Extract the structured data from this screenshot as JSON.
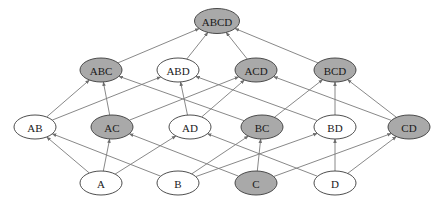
{
  "diagram": {
    "type": "hasse-diagram",
    "colors": {
      "highlighted_fill": "#a9a9a9",
      "normal_fill": "#ffffff",
      "stroke": "#3a3a3a",
      "edge": "#7a7a7a",
      "text": "#1a1a1a"
    },
    "node_size": {
      "rx": 21,
      "ry": 12,
      "top_rx": 22.5,
      "top_ry": 12.5
    },
    "nodes": [
      {
        "id": "ABCD",
        "label": "ABCD",
        "x": 217,
        "y": 21,
        "highlighted": true
      },
      {
        "id": "ABC",
        "label": "ABC",
        "x": 101,
        "y": 70,
        "highlighted": true
      },
      {
        "id": "ABD",
        "label": "ABD",
        "x": 178,
        "y": 70,
        "highlighted": false
      },
      {
        "id": "ACD",
        "label": "ACD",
        "x": 256,
        "y": 70,
        "highlighted": true
      },
      {
        "id": "BCD",
        "label": "BCD",
        "x": 335,
        "y": 70,
        "highlighted": true
      },
      {
        "id": "AB",
        "label": "AB",
        "x": 35,
        "y": 127,
        "highlighted": false
      },
      {
        "id": "AC",
        "label": "AC",
        "x": 112,
        "y": 127,
        "highlighted": true
      },
      {
        "id": "AD",
        "label": "AD",
        "x": 190,
        "y": 127,
        "highlighted": false
      },
      {
        "id": "BC",
        "label": "BC",
        "x": 262,
        "y": 127,
        "highlighted": true
      },
      {
        "id": "BD",
        "label": "BD",
        "x": 335,
        "y": 127,
        "highlighted": false
      },
      {
        "id": "CD",
        "label": "CD",
        "x": 409,
        "y": 127,
        "highlighted": true
      },
      {
        "id": "A",
        "label": "A",
        "x": 101,
        "y": 183,
        "highlighted": false
      },
      {
        "id": "B",
        "label": "B",
        "x": 178,
        "y": 183,
        "highlighted": false
      },
      {
        "id": "C",
        "label": "C",
        "x": 256,
        "y": 183,
        "highlighted": true
      },
      {
        "id": "D",
        "label": "D",
        "x": 335,
        "y": 183,
        "highlighted": false
      }
    ],
    "edges": [
      {
        "from": "ABC",
        "to": "ABCD"
      },
      {
        "from": "ABD",
        "to": "ABCD"
      },
      {
        "from": "ACD",
        "to": "ABCD"
      },
      {
        "from": "BCD",
        "to": "ABCD"
      },
      {
        "from": "AB",
        "to": "ABC"
      },
      {
        "from": "AB",
        "to": "ABD"
      },
      {
        "from": "AC",
        "to": "ABC"
      },
      {
        "from": "AC",
        "to": "ACD"
      },
      {
        "from": "AD",
        "to": "ABD"
      },
      {
        "from": "AD",
        "to": "ACD"
      },
      {
        "from": "BC",
        "to": "ABC"
      },
      {
        "from": "BC",
        "to": "BCD"
      },
      {
        "from": "BD",
        "to": "ABD"
      },
      {
        "from": "BD",
        "to": "BCD"
      },
      {
        "from": "CD",
        "to": "ACD"
      },
      {
        "from": "CD",
        "to": "BCD"
      },
      {
        "from": "A",
        "to": "AB"
      },
      {
        "from": "A",
        "to": "AC"
      },
      {
        "from": "A",
        "to": "AD"
      },
      {
        "from": "B",
        "to": "AB"
      },
      {
        "from": "B",
        "to": "BC"
      },
      {
        "from": "B",
        "to": "BD"
      },
      {
        "from": "C",
        "to": "AC"
      },
      {
        "from": "C",
        "to": "BC"
      },
      {
        "from": "C",
        "to": "CD"
      },
      {
        "from": "D",
        "to": "AD"
      },
      {
        "from": "D",
        "to": "BD"
      },
      {
        "from": "D",
        "to": "CD"
      }
    ]
  }
}
